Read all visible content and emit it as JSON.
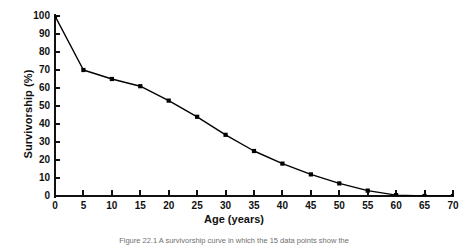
{
  "figure": {
    "caption": "Figure 22.1   A survivorship curve in which the 15 data points show the",
    "xlabel": "Age (years)",
    "ylabel": "Survivorship (%)"
  },
  "chart_data": {
    "type": "line",
    "title": "",
    "xlabel": "Age (years)",
    "ylabel": "Survivorship (%)",
    "xlim": [
      0,
      70
    ],
    "ylim": [
      0,
      100
    ],
    "xticks": [
      0,
      5,
      10,
      15,
      20,
      25,
      30,
      35,
      40,
      45,
      50,
      55,
      60,
      65,
      70
    ],
    "yticks": [
      0,
      10,
      20,
      30,
      40,
      50,
      60,
      70,
      80,
      90,
      100
    ],
    "xtick_labels": [
      "0",
      "5",
      "10",
      "15",
      "20",
      "25",
      "30",
      "35",
      "40",
      "45",
      "50",
      "55",
      "60",
      "65",
      "70"
    ],
    "ytick_labels": [
      "0",
      "10",
      "20",
      "30",
      "40",
      "50",
      "60",
      "70",
      "80",
      "90",
      "100"
    ],
    "grid": false,
    "legend": false,
    "marker": "square",
    "marker_color": "#000000",
    "line_color": "#000000",
    "x": [
      0,
      5,
      10,
      15,
      20,
      25,
      30,
      35,
      40,
      45,
      50,
      55,
      60,
      65,
      70
    ],
    "values": [
      100,
      70,
      65,
      61,
      53,
      44,
      34,
      25,
      18,
      12,
      7,
      3,
      0.5,
      0,
      0
    ],
    "series": [
      {
        "name": "Survivorship",
        "values": [
          100,
          70,
          65,
          61,
          53,
          44,
          34,
          25,
          18,
          12,
          7,
          3,
          0.5,
          0,
          0
        ]
      }
    ]
  }
}
